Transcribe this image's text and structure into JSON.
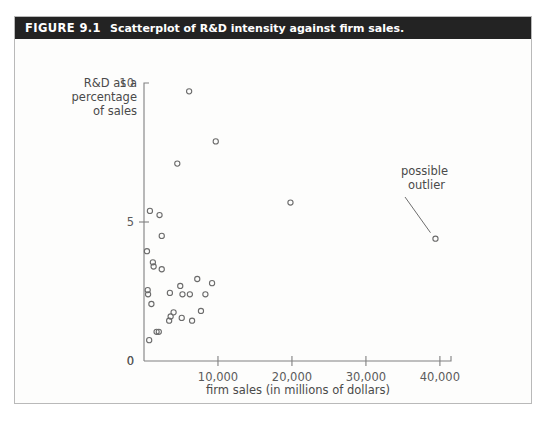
{
  "figure": {
    "number_label": "FIGURE 9.1",
    "caption": "Scatterplot of R&D intensity against firm sales."
  },
  "annotations": [
    {
      "name": "possible-outlier",
      "line1": "possible",
      "line2": "outlier"
    }
  ],
  "chart_data": {
    "type": "scatter",
    "title": "Scatterplot of R&D intensity against firm sales.",
    "xlabel": "firm sales (in millions of dollars)",
    "ylabel": "R&D as a percentage of sales",
    "ylabel_lines": [
      "R&D as a",
      "percentage",
      "of sales"
    ],
    "xlim": [
      0,
      41500
    ],
    "ylim": [
      0,
      10
    ],
    "xticks": [
      0,
      10000,
      20000,
      30000,
      40000
    ],
    "xticklabels": [
      "0",
      "10,000",
      "20,000",
      "30,000",
      "40,000"
    ],
    "yticks": [
      0,
      5,
      10
    ],
    "yticklabels": [
      "0",
      "5",
      "10"
    ],
    "grid": false,
    "legend": null,
    "marker": "open-circle",
    "marker_color": "#6b6b6b",
    "series": [
      {
        "name": "firms",
        "points": [
          [
            6100,
            9.7
          ],
          [
            9700,
            7.9
          ],
          [
            4500,
            7.1
          ],
          [
            19800,
            5.7
          ],
          [
            800,
            5.4
          ],
          [
            2100,
            5.25
          ],
          [
            2400,
            4.5
          ],
          [
            400,
            3.95
          ],
          [
            1200,
            3.55
          ],
          [
            1300,
            3.4
          ],
          [
            2400,
            3.3
          ],
          [
            7200,
            2.95
          ],
          [
            9200,
            2.8
          ],
          [
            4900,
            2.7
          ],
          [
            500,
            2.55
          ],
          [
            550,
            2.4
          ],
          [
            3500,
            2.45
          ],
          [
            6200,
            2.4
          ],
          [
            8300,
            2.4
          ],
          [
            1000,
            2.05
          ],
          [
            5200,
            2.4
          ],
          [
            4000,
            1.75
          ],
          [
            3600,
            1.6
          ],
          [
            3400,
            1.45
          ],
          [
            5100,
            1.55
          ],
          [
            6500,
            1.45
          ],
          [
            7700,
            1.8
          ],
          [
            1700,
            1.05
          ],
          [
            2000,
            1.05
          ],
          [
            700,
            0.75
          ],
          [
            39400,
            4.4
          ]
        ]
      }
    ],
    "outlier_point": [
      39400,
      4.4
    ]
  },
  "geometry": {
    "plot_left": 129,
    "plot_right": 436,
    "plot_top": 44,
    "plot_bottom": 322
  }
}
